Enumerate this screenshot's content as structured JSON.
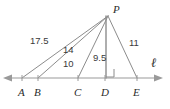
{
  "figure": {
    "type": "geometry-diagram",
    "apex": {
      "label": "P",
      "x": 108,
      "y": 16
    },
    "line": {
      "label": "ℓ",
      "label_x": 152,
      "label_y": 61,
      "y": 78,
      "x_start": 4,
      "x_end": 162,
      "arrow_left": true,
      "arrow_right": true
    },
    "points": [
      {
        "label": "A",
        "x": 22,
        "label_x": 18,
        "label_y": 85
      },
      {
        "label": "B",
        "x": 38,
        "label_x": 34,
        "label_y": 85
      },
      {
        "label": "C",
        "x": 78,
        "label_x": 74,
        "label_y": 85
      },
      {
        "label": "D",
        "x": 105,
        "label_x": 101,
        "label_y": 85
      },
      {
        "label": "E",
        "x": 137,
        "label_x": 133,
        "label_y": 85
      }
    ],
    "segments": [
      {
        "from": "P",
        "to": "A",
        "length_label": "17.5",
        "label_x": 30,
        "label_y": 36
      },
      {
        "from": "P",
        "to": "B",
        "length_label": "14",
        "label_x": 62,
        "label_y": 46
      },
      {
        "from": "P",
        "to": "C",
        "length_label": "10",
        "label_x": 62,
        "label_y": 60
      },
      {
        "from": "P",
        "to": "D",
        "length_label": "9.5",
        "label_x": 94,
        "label_y": 54
      },
      {
        "from": "P",
        "to": "E",
        "length_label": "11",
        "label_x": 130,
        "label_y": 39
      }
    ],
    "right_angle": {
      "at": "D",
      "x": 106,
      "y": 69,
      "size": 8
    },
    "colors": {
      "stroke": "#8c8c8c",
      "line_stroke": "#9a9a9a",
      "text": "#2b2b2b",
      "length_text": "#3a3a3a",
      "background": "#ffffff"
    }
  }
}
